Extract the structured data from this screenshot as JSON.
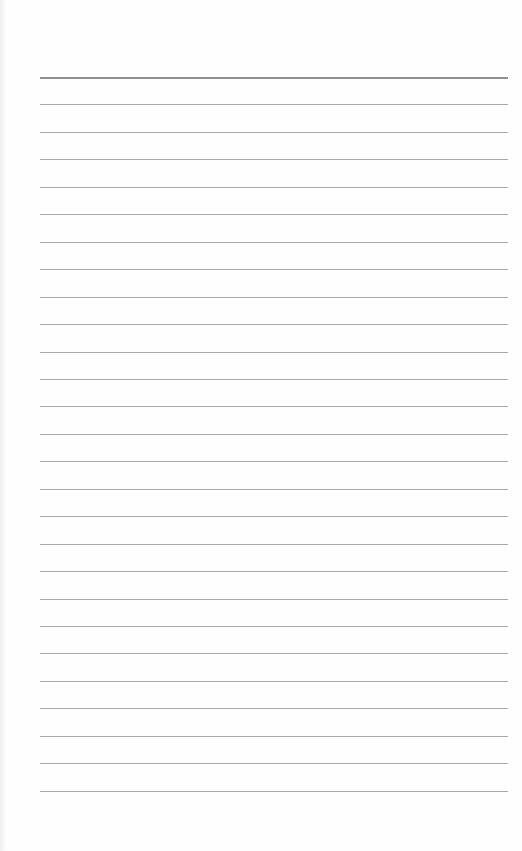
{
  "page": {
    "type": "lined-notebook-paper",
    "background_color": "#fefefe",
    "line_color": "#a9a9a9",
    "header_line_color": "#8f8f8f",
    "line_count": 27,
    "first_line_y": 77,
    "line_spacing": 27.45,
    "line_left": 40,
    "line_right": 508
  }
}
